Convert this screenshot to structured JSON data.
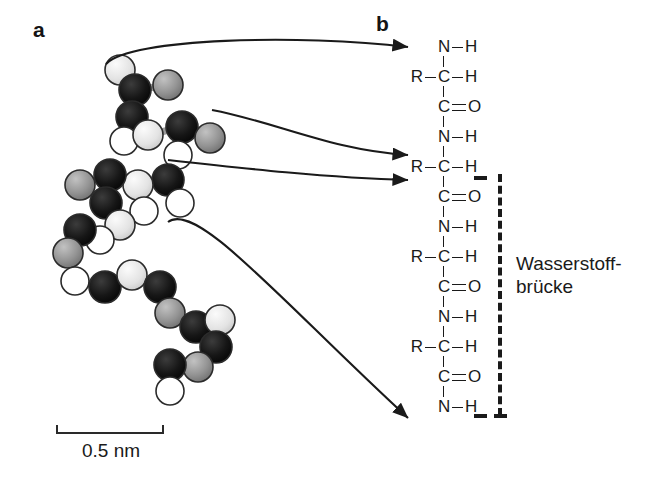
{
  "figure": {
    "panels": [
      {
        "id": "a",
        "label": "a",
        "caption": "ball-and-stick polypeptide model"
      },
      {
        "id": "b",
        "label": "b",
        "caption": "peptide backbone chain diagram"
      }
    ]
  },
  "scalebar": {
    "text": "0.5 nm",
    "length_px": 108
  },
  "annotation": {
    "line1": "Wasserstoff-",
    "line2": "brücke"
  },
  "chain": {
    "rows": [
      {
        "index": 0,
        "left": "",
        "center": "N",
        "bond": "single",
        "right": "H"
      },
      {
        "index": 1,
        "left": "R",
        "center": "C",
        "bond": "single",
        "right": "H"
      },
      {
        "index": 2,
        "left": "",
        "center": "C",
        "bond": "double",
        "right": "O"
      },
      {
        "index": 3,
        "left": "",
        "center": "N",
        "bond": "single",
        "right": "H"
      },
      {
        "index": 4,
        "left": "R",
        "center": "C",
        "bond": "single",
        "right": "H"
      },
      {
        "index": 5,
        "left": "",
        "center": "C",
        "bond": "double",
        "right": "O"
      },
      {
        "index": 6,
        "left": "",
        "center": "N",
        "bond": "single",
        "right": "H"
      },
      {
        "index": 7,
        "left": "R",
        "center": "C",
        "bond": "single",
        "right": "H"
      },
      {
        "index": 8,
        "left": "",
        "center": "C",
        "bond": "double",
        "right": "O"
      },
      {
        "index": 9,
        "left": "",
        "center": "N",
        "bond": "single",
        "right": "H"
      },
      {
        "index": 10,
        "left": "R",
        "center": "C",
        "bond": "single",
        "right": "H"
      },
      {
        "index": 11,
        "left": "",
        "center": "C",
        "bond": "double",
        "right": "O"
      },
      {
        "index": 12,
        "left": "",
        "center": "N",
        "bond": "single",
        "right": "H"
      }
    ]
  },
  "arrows": [
    {
      "id": 1,
      "from_atom": "amide-hydrogen-upper",
      "to_row": 0
    },
    {
      "id": 2,
      "from_atom": "carbonyl-oxygen-upper",
      "to_row": 4
    },
    {
      "id": 3,
      "from_atom": "carbonyl-carbon-mid",
      "to_row": 5
    },
    {
      "id": 4,
      "from_atom": "amide-nitrogen-lower",
      "to_row": 12
    }
  ],
  "colors": {
    "carbon": "#131313",
    "oxygen": "#8f8f8f",
    "nitrogen": "#e4e4e4",
    "hydrogen": "#ffffff",
    "outline": "#2a2a2a",
    "bond": "#9a9a9a",
    "ink": "#1a1a1a"
  }
}
